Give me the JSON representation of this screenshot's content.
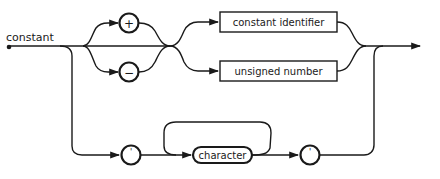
{
  "diagram": {
    "type": "syntax-diagram",
    "title": "constant",
    "terminals": {
      "plus": "+",
      "minus": "−",
      "quote_open": "'",
      "quote_close": "'"
    },
    "nonterminals": {
      "constant_identifier": "constant identifier",
      "unsigned_number": "unsigned number",
      "character": "character"
    },
    "colors": {
      "stroke": "#1a1a1a",
      "background": "#ffffff"
    }
  }
}
